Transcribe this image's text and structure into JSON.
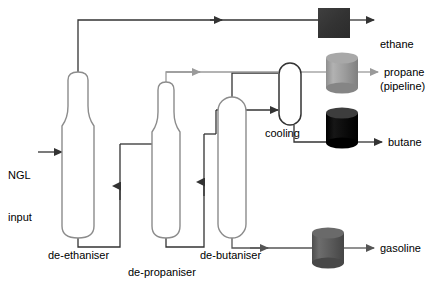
{
  "diagram": {
    "background": "#ffffff",
    "line_color_dark": "#333333",
    "line_color_light": "#9a9a9a",
    "vessel_outline": "#8c8c8c"
  },
  "inputs": [
    {
      "name": "ngl-input",
      "line1": "NGL",
      "line2": "input"
    }
  ],
  "columns": [
    {
      "name": "de-ethaniser",
      "label": "de-ethaniser",
      "shape": "bottle"
    },
    {
      "name": "de-propaniser",
      "label": "de-propaniser",
      "shape": "bottle"
    },
    {
      "name": "de-butaniser",
      "label": "de-butaniser",
      "shape": "capsule"
    }
  ],
  "units": [
    {
      "name": "cooling",
      "label": "cooling",
      "shape": "capsule"
    }
  ],
  "products": [
    {
      "name": "ethane",
      "line1": "ethane",
      "line2": "(pipeline)",
      "storage": "square-box",
      "color": "#3a3a3a",
      "arrow_color": "#333333"
    },
    {
      "name": "propane",
      "line1": "propane",
      "line2": "",
      "storage": "cylinder-tank",
      "color": "#9a9a9a",
      "arrow_color": "#9a9a9a"
    },
    {
      "name": "butane",
      "line1": "butane",
      "line2": "",
      "storage": "cylinder-tank",
      "color": "#0b0b0b",
      "arrow_color": "#333333"
    },
    {
      "name": "gasoline",
      "line1": "gasoline",
      "line2": "",
      "storage": "cylinder-tank",
      "color": "#5c5c5c",
      "arrow_color": "#555555"
    }
  ]
}
